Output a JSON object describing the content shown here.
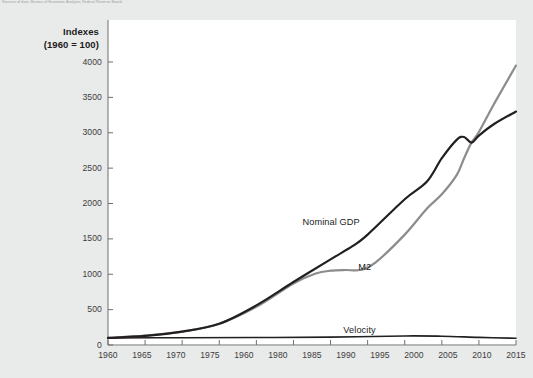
{
  "figure": {
    "source_caption": "Sources of data: Bureau of Economic Analysis; Federal Reserve Board."
  },
  "chart_data": {
    "type": "line",
    "title": "",
    "ylabel_line1": "Indexes",
    "ylabel_line2": "(1960 = 100)",
    "xlabel": "",
    "grid": false,
    "legend_position": "inline-annotations",
    "xlim": [
      1960,
      2015
    ],
    "ylim": [
      0,
      4000
    ],
    "yticks": [
      0,
      500,
      1000,
      1500,
      2000,
      2500,
      3000,
      3500,
      4000
    ],
    "ytick_labels": [
      "0",
      "500",
      "1000",
      "1500",
      "2000",
      "2500",
      "3000",
      "3500",
      "4000"
    ],
    "xticks": [
      1960,
      1965,
      1970,
      1975,
      1980,
      1985,
      1990,
      1995,
      2000,
      2005,
      2010,
      2015
    ],
    "xtick_labels": [
      "1960",
      "1965",
      "1970",
      "1975",
      "1960",
      "1980",
      "1985",
      "1990",
      "1995",
      "2000",
      "2005",
      "2010",
      "2015"
    ],
    "xtick_label_note": "The fifth tick is labeled 1960 in the source image (typo for 1980); 13 labels are drawn across 12 tick intervals.",
    "colors": {
      "nominal_gdp": "#231f20",
      "m2": "#8b8c8e",
      "velocity": "#231f20",
      "panel_background": "#ffffff",
      "page_background": "#e9eaea",
      "axis": "#6e6f71"
    },
    "annotations": [
      {
        "text": "Nominal GDP",
        "x": 1990,
        "y": 1720
      },
      {
        "text": "M2",
        "x": 1997.5,
        "y": 1090
      },
      {
        "text": "Velocity",
        "x": 1995.5,
        "y": 195
      }
    ],
    "series": [
      {
        "name": "Nominal GDP",
        "color": "#231f20",
        "x": [
          1960,
          1965,
          1970,
          1975,
          1980,
          1985,
          1990,
          1993,
          1995,
          2000,
          2003,
          2005,
          2007,
          2008,
          2009,
          2010,
          2012,
          2015
        ],
        "values": [
          100,
          130,
          190,
          300,
          560,
          890,
          1210,
          1400,
          1560,
          2060,
          2310,
          2640,
          2900,
          2940,
          2860,
          2960,
          3120,
          3300
        ]
      },
      {
        "name": "M2",
        "color": "#8b8c8e",
        "x": [
          1960,
          1965,
          1970,
          1975,
          1980,
          1985,
          1988,
          1990,
          1992,
          1994,
          1996,
          2000,
          2003,
          2005,
          2007,
          2008,
          2009,
          2010,
          2012,
          2015
        ],
        "values": [
          100,
          132,
          188,
          300,
          540,
          870,
          1010,
          1050,
          1060,
          1060,
          1160,
          1560,
          1930,
          2130,
          2400,
          2640,
          2860,
          3010,
          3400,
          3950
        ]
      },
      {
        "name": "Velocity",
        "color": "#231f20",
        "x": [
          1960,
          1970,
          1980,
          1990,
          2000,
          2005,
          2010,
          2015
        ],
        "values": [
          100,
          103,
          106,
          112,
          128,
          124,
          108,
          95
        ]
      }
    ]
  }
}
